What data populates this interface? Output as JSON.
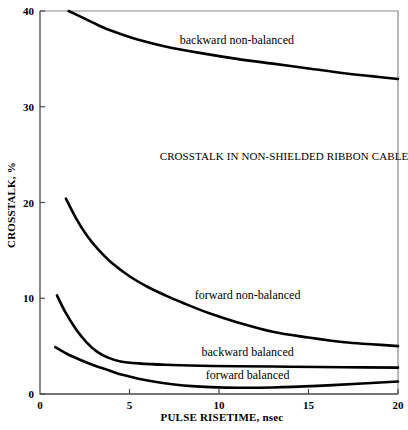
{
  "chart_data": {
    "type": "line",
    "title": "CROSSTALK IN NON-SHIELDED RIBBON CABLE",
    "xlabel": "PULSE RISETIME, nsec",
    "ylabel": "CROSSTALK, %",
    "xlim": [
      0,
      20
    ],
    "ylim": [
      0,
      40
    ],
    "xticks": [
      "0",
      "5",
      "10",
      "15",
      "20"
    ],
    "xtick_values": [
      0,
      5,
      10,
      15,
      20
    ],
    "yticks": [
      "0",
      "10",
      "20",
      "30",
      "40"
    ],
    "ytick_values": [
      0,
      10,
      20,
      30,
      40
    ],
    "grid": false,
    "legend": "inline-curve-labels",
    "series": [
      {
        "name": "backward non-balanced",
        "label": "backward non-balanced",
        "label_x": 11.0,
        "label_y": 36.6,
        "x": [
          1.6,
          2.5,
          3.5,
          4.5,
          5.5,
          7.0,
          9.0,
          11.0,
          13.0,
          15.0,
          17.0,
          18.5,
          20.0
        ],
        "y": [
          40.0,
          39.2,
          38.3,
          37.6,
          37.0,
          36.3,
          35.6,
          35.0,
          34.5,
          34.0,
          33.5,
          33.2,
          32.9
        ]
      },
      {
        "name": "forward non-balanced",
        "label": "forward non-balanced",
        "label_x": 11.6,
        "label_y": 9.9,
        "x": [
          1.45,
          2.0,
          2.6,
          3.2,
          4.0,
          5.0,
          6.0,
          7.0,
          8.0,
          9.5,
          11.0,
          13.0,
          15.0,
          17.0,
          18.5,
          20.0
        ],
        "y": [
          20.4,
          18.4,
          16.6,
          15.2,
          13.7,
          12.3,
          11.2,
          10.3,
          9.5,
          8.4,
          7.5,
          6.5,
          5.9,
          5.4,
          5.2,
          5.0
        ]
      },
      {
        "name": "backward balanced",
        "label": "backward balanced",
        "label_x": 11.6,
        "label_y": 4.0,
        "x": [
          0.95,
          1.4,
          2.0,
          2.6,
          3.2,
          3.8,
          4.5,
          5.5,
          7.0,
          9.0,
          11.0,
          14.0,
          17.0,
          20.0
        ],
        "y": [
          10.3,
          8.6,
          6.8,
          5.4,
          4.4,
          3.8,
          3.4,
          3.2,
          3.05,
          2.95,
          2.9,
          2.85,
          2.8,
          2.75
        ]
      },
      {
        "name": "forward balanced",
        "label": "forward balanced",
        "label_x": 11.6,
        "label_y": 1.55,
        "x": [
          0.85,
          1.5,
          2.2,
          3.0,
          3.8,
          4.6,
          5.5,
          6.5,
          7.5,
          8.5,
          9.5,
          11.0,
          13.0,
          15.5,
          18.0,
          20.0
        ],
        "y": [
          4.9,
          4.2,
          3.6,
          3.0,
          2.5,
          2.0,
          1.6,
          1.25,
          1.0,
          0.82,
          0.72,
          0.65,
          0.68,
          0.85,
          1.1,
          1.3
        ]
      }
    ]
  },
  "colors": {
    "curve": "#000000",
    "frame": "#8a8a8a",
    "axis": "#4a4a4a",
    "background": "#ffffff"
  }
}
